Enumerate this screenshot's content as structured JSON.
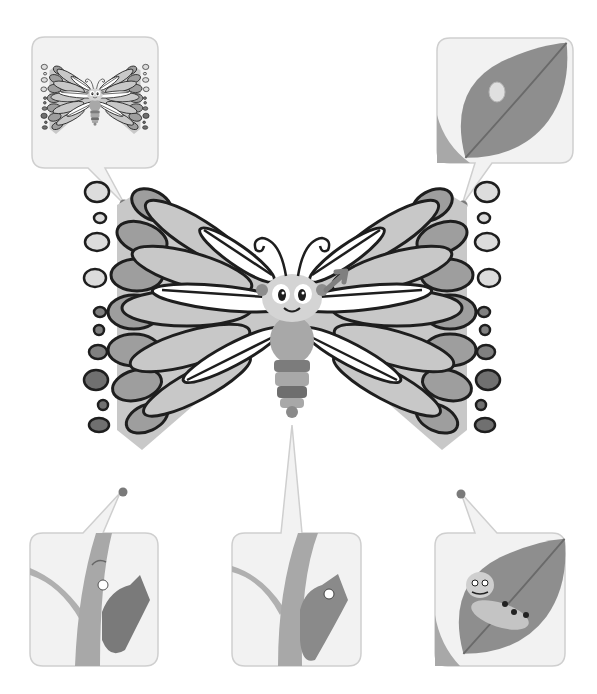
{
  "diagram": {
    "type": "life-cycle",
    "center": {
      "name": "butterfly-adult",
      "has_arrow": true
    },
    "stages": [
      {
        "id": "adult",
        "position": "top-left"
      },
      {
        "id": "egg",
        "position": "top-right"
      },
      {
        "id": "caterpillar",
        "position": "bottom-right"
      },
      {
        "id": "chrysalis",
        "position": "bottom-center"
      },
      {
        "id": "emerging-butterfly",
        "position": "bottom-left"
      }
    ],
    "colors": {
      "panel_bg": "#f2f2f2",
      "panel_border": "#cfcfcf",
      "connector_dot": "#7a7a7a",
      "leaf": "#8c8c8c",
      "stem": "#a8a8a8",
      "wing_light": "#cccccc",
      "wing_mid": "#a6a6a6",
      "wing_dark": "#808080",
      "outline": "#1e1e1e"
    }
  }
}
